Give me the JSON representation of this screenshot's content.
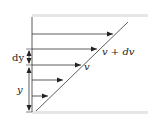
{
  "diagram": {
    "labels": {
      "dy": "dy",
      "y": "y",
      "v": "v",
      "v_plus_dv": "v + dv"
    },
    "colors": {
      "line": "#333333",
      "plate": "#e6e6e6",
      "background": "#ffffff"
    },
    "velocity_arrows": [
      {
        "y": 34,
        "x_end": 113
      },
      {
        "y": 49,
        "x_end": 97
      },
      {
        "y": 65,
        "x_end": 81
      },
      {
        "y": 80,
        "x_end": 63
      },
      {
        "y": 96,
        "x_end": 48
      }
    ]
  }
}
